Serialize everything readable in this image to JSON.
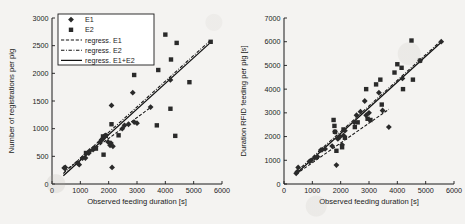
{
  "figure": {
    "background_color": "#f4f3f1",
    "marker_color": "#2a2a2a",
    "axis_color": "#1b1b1b"
  },
  "legend": {
    "entries": [
      {
        "label": "E1",
        "symbol": "diamond-marker"
      },
      {
        "label": "E2",
        "symbol": "square-marker"
      },
      {
        "label": "regress. E1",
        "symbol": "dashed-line"
      },
      {
        "label": "regress. E2",
        "symbol": "dashdot-line"
      },
      {
        "label": "regress. E1+E2",
        "symbol": "solid-line"
      }
    ]
  },
  "chart_data": [
    {
      "type": "scatter",
      "panel": "left",
      "title": "",
      "xlabel": "Observed feeding duration [s]",
      "ylabel": "Number of registrations per pig",
      "xlim": [
        0,
        6000
      ],
      "ylim": [
        0,
        3000
      ],
      "xticks": [
        0,
        1000,
        2000,
        3000,
        4000,
        5000,
        6000
      ],
      "yticks": [
        0,
        500,
        1000,
        1500,
        2000,
        2500,
        3000
      ],
      "grid": false,
      "legend_position": "upper-left",
      "series": [
        {
          "name": "E1",
          "marker": "diamond",
          "points": [
            [
              430,
              290
            ],
            [
              470,
              300
            ],
            [
              900,
              380
            ],
            [
              960,
              350
            ],
            [
              1080,
              470
            ],
            [
              1180,
              470
            ],
            [
              1300,
              560
            ],
            [
              1330,
              600
            ],
            [
              1450,
              620
            ],
            [
              1500,
              660
            ],
            [
              1700,
              760
            ],
            [
              1750,
              800
            ],
            [
              1800,
              820
            ],
            [
              1830,
              850
            ],
            [
              1870,
              870
            ],
            [
              1900,
              880
            ],
            [
              1980,
              760
            ],
            [
              2050,
              700
            ],
            [
              2080,
              740
            ],
            [
              2100,
              1420
            ],
            [
              2120,
              300
            ],
            [
              2150,
              680
            ],
            [
              2480,
              1000
            ],
            [
              2560,
              1060
            ],
            [
              2700,
              1080
            ],
            [
              2850,
              1650
            ],
            [
              2900,
              1120
            ],
            [
              3000,
              1100
            ],
            [
              3480,
              1390
            ],
            [
              4180,
              1880
            ]
          ]
        },
        {
          "name": "E2",
          "marker": "square",
          "points": [
            [
              1200,
              560
            ],
            [
              1550,
              640
            ],
            [
              1800,
              860
            ],
            [
              1820,
              530
            ],
            [
              1900,
              870
            ],
            [
              2100,
              1080
            ],
            [
              2350,
              880
            ],
            [
              2900,
              1970
            ],
            [
              3400,
              2200
            ],
            [
              3700,
              1060
            ],
            [
              3750,
              2060
            ],
            [
              4000,
              2700
            ],
            [
              4180,
              1360
            ],
            [
              4200,
              2250
            ],
            [
              4350,
              870
            ],
            [
              4400,
              2550
            ],
            [
              4850,
              1840
            ],
            [
              5600,
              2570
            ]
          ]
        }
      ],
      "regressions": [
        {
          "name": "regress. E1",
          "style": "dashed",
          "x": [
            430,
            3500
          ],
          "y": [
            230,
            1390
          ]
        },
        {
          "name": "regress. E2",
          "style": "dashdot",
          "x": [
            400,
            5600
          ],
          "y": [
            190,
            2600
          ]
        },
        {
          "name": "regress. E1+E2",
          "style": "solid",
          "x": [
            400,
            5600
          ],
          "y": [
            150,
            2560
          ]
        }
      ]
    },
    {
      "type": "scatter",
      "panel": "right",
      "title": "",
      "xlabel": "Observed feeding duration [s]",
      "ylabel": "Duration RFID feeding per pig [s]",
      "xlim": [
        0,
        6000
      ],
      "ylim": [
        0,
        7000
      ],
      "xticks": [
        0,
        1000,
        2000,
        3000,
        4000,
        5000,
        6000
      ],
      "yticks": [
        0,
        1000,
        2000,
        3000,
        4000,
        5000,
        6000,
        7000
      ],
      "grid": false,
      "legend_position": "none",
      "series": [
        {
          "name": "E1",
          "marker": "diamond",
          "points": [
            [
              430,
              450
            ],
            [
              470,
              520
            ],
            [
              500,
              700
            ],
            [
              900,
              950
            ],
            [
              960,
              1000
            ],
            [
              1080,
              1100
            ],
            [
              1180,
              1150
            ],
            [
              1300,
              1430
            ],
            [
              1350,
              1450
            ],
            [
              1450,
              1480
            ],
            [
              1700,
              1600
            ],
            [
              1800,
              2200
            ],
            [
              1850,
              800
            ],
            [
              1900,
              1900
            ],
            [
              1980,
              2000
            ],
            [
              2050,
              1650
            ],
            [
              2100,
              2050
            ],
            [
              2150,
              2250
            ],
            [
              2480,
              2600
            ],
            [
              2560,
              2900
            ],
            [
              2700,
              3050
            ],
            [
              2850,
              3500
            ],
            [
              2900,
              2900
            ],
            [
              3000,
              3000
            ],
            [
              3350,
              3850
            ],
            [
              3480,
              3100
            ],
            [
              3700,
              2400
            ],
            [
              4180,
              4450
            ],
            [
              4800,
              5200
            ],
            [
              5550,
              6000
            ]
          ]
        },
        {
          "name": "E2",
          "marker": "square",
          "points": [
            [
              1750,
              2700
            ],
            [
              1780,
              2450
            ],
            [
              1800,
              2200
            ],
            [
              1850,
              1400
            ],
            [
              2050,
              1550
            ],
            [
              2100,
              2300
            ],
            [
              2150,
              1950
            ],
            [
              2500,
              2400
            ],
            [
              2600,
              2600
            ],
            [
              2900,
              4000
            ],
            [
              2950,
              2750
            ],
            [
              3050,
              2700
            ],
            [
              3250,
              4200
            ],
            [
              3400,
              4400
            ],
            [
              3450,
              3350
            ],
            [
              3900,
              4700
            ],
            [
              4000,
              5050
            ],
            [
              4150,
              4900
            ],
            [
              4200,
              4000
            ],
            [
              4500,
              6050
            ],
            [
              4550,
              4400
            ],
            [
              4800,
              5200
            ]
          ]
        }
      ],
      "regressions": [
        {
          "name": "regress. E1",
          "style": "dashed",
          "x": [
            430,
            3700
          ],
          "y": [
            420,
            3150
          ]
        },
        {
          "name": "regress. E2",
          "style": "dashdot",
          "x": [
            420,
            5550
          ],
          "y": [
            500,
            6050
          ]
        },
        {
          "name": "regress. E1+E2",
          "style": "solid",
          "x": [
            420,
            5550
          ],
          "y": [
            420,
            5980
          ]
        }
      ]
    }
  ]
}
